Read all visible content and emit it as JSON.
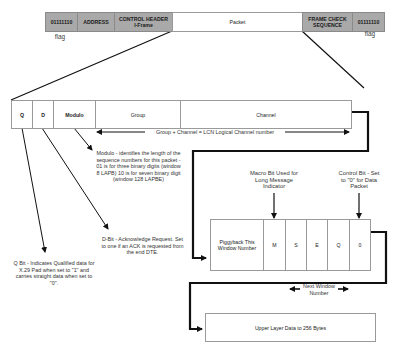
{
  "frame": {
    "cells": [
      {
        "id": "flag-start",
        "label": "01111110"
      },
      {
        "id": "address",
        "label": "ADDRESS"
      },
      {
        "id": "control",
        "label": "CONTROL HEADER I-Frame"
      },
      {
        "id": "packet",
        "label": "Packet"
      },
      {
        "id": "fcs",
        "label": "FRAME CHECK SEQUENCE"
      },
      {
        "id": "flag-end",
        "label": "01111110"
      }
    ],
    "flag_label_left": "flag",
    "flag_label_right": "flag"
  },
  "packet_header": {
    "cells": [
      {
        "id": "q",
        "label": "Q"
      },
      {
        "id": "d",
        "label": "D"
      },
      {
        "id": "modulo",
        "label": "Modulo"
      },
      {
        "id": "group",
        "label": "Group"
      },
      {
        "id": "channel",
        "label": "Channel"
      }
    ],
    "lcn_note": "Group + Channel = LCN Logical Channel number"
  },
  "annotations": {
    "modulo": "Modulo - identifies the length of the sequence numbers for this packet - 01 is for three binary digits (window 8 LAPB) 10 is for seven binary digit (window 128 LAPBE)",
    "d_bit": "D-Bit - Acknowledge Request. Set to one if an ACK is requested from the end DTE.",
    "q_bit": "Q Bit - Indicates Qualified data for X.29 Pad when set to \"1\" and carries straight data when set to \"0\".",
    "macro_bit": "Macro Bit Used for Long Message Indicator",
    "control_bit": "Control Bit - Set to \"0\" for Data Packet",
    "next_window": "Next Window Number"
  },
  "control_field": {
    "cells": [
      {
        "id": "piggyback",
        "label": "Piggyback This Window Number"
      },
      {
        "id": "m",
        "label": "M"
      },
      {
        "id": "s",
        "label": "S"
      },
      {
        "id": "e",
        "label": "E"
      },
      {
        "id": "q2",
        "label": "Q"
      },
      {
        "id": "zero",
        "label": "0"
      }
    ]
  },
  "data_box": {
    "label": "Upper Layer Data to 256 Bytes"
  }
}
